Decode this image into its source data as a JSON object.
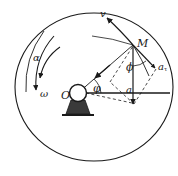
{
  "figure": {
    "caption": "",
    "geometry": {
      "disk": {
        "cx": 94,
        "cy": 87,
        "rx": 79,
        "ry": 74
      },
      "center_hub": {
        "cx": 78,
        "cy": 93,
        "r": 8
      },
      "point_M": {
        "x": 133,
        "y": 45
      },
      "accel_total_tip": {
        "x": 133,
        "y": 103
      },
      "accel_tangential_tip": {
        "x": 156,
        "y": 69
      },
      "velocity_tip": {
        "x": 106,
        "y": 16
      },
      "normal_accel_tip": {
        "x": 96,
        "y": 71
      }
    },
    "colors": {
      "stroke": "#1a1a1a",
      "hub_fill": "#3a3a3a",
      "background": "#ffffff"
    },
    "labels": {
      "point": "M",
      "velocity": "v",
      "tangential_acceleration": "a",
      "tangential_acceleration_subscript": "τ",
      "total_acceleration": "a",
      "angle_between_accel_and_radius": "ϕ",
      "rotation_angle": "φ",
      "center": "O",
      "angular_acceleration": "α",
      "angular_velocity": "ω"
    }
  }
}
